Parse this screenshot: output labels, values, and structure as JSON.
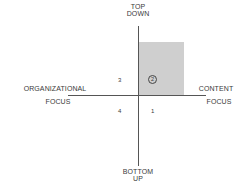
{
  "diagram": {
    "axes": {
      "top": [
        "TOP",
        "DOWN"
      ],
      "bottom": [
        "BOTTOM",
        "UP"
      ],
      "left": [
        "ORGANIZATIONAL",
        "FOCUS"
      ],
      "right": [
        "CONTENT",
        "FOCUS"
      ]
    },
    "quadrants": [
      {
        "id": "1",
        "label": "1",
        "position": "bottom-right"
      },
      {
        "id": "2",
        "label": "2",
        "position": "top-right",
        "highlighted": true,
        "circled": true
      },
      {
        "id": "3",
        "label": "3",
        "position": "top-left"
      },
      {
        "id": "4",
        "label": "4",
        "position": "bottom-left"
      }
    ],
    "colors": {
      "highlight": "#cfcfcf",
      "axis": "#555555",
      "text": "#3a3a3a"
    }
  }
}
